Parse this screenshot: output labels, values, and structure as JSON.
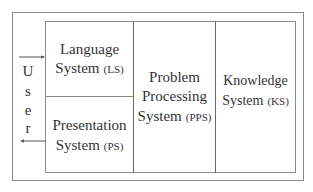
{
  "user": {
    "letters": [
      "U",
      "s",
      "e",
      "r"
    ],
    "label": "User"
  },
  "components": {
    "ls": {
      "line1": "Language",
      "line2": "System",
      "abbr": "(LS)"
    },
    "ps": {
      "line1": "Presentation",
      "line2": "System",
      "abbr": "(PS)"
    },
    "pps": {
      "line1": "Problem",
      "line2": "Processing",
      "line3": "System",
      "abbr": "(PPS)"
    },
    "ks": {
      "line1": "Knowledge",
      "line2": "System",
      "abbr": "(KS)"
    }
  },
  "arrows": {
    "input": {
      "from": "User",
      "to": "Language System (LS)"
    },
    "output": {
      "from": "Presentation System (PS)",
      "to": "User"
    }
  }
}
